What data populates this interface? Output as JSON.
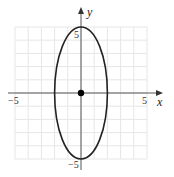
{
  "chart_data": {
    "type": "line",
    "title": "",
    "xlabel": "x",
    "ylabel": "y",
    "xlim": [
      -5,
      5
    ],
    "ylim": [
      -5,
      5
    ],
    "grid": true,
    "x_tick_labels": [
      "-5",
      "5"
    ],
    "y_tick_labels": [
      "5",
      "-5"
    ],
    "series": [
      {
        "name": "ellipse",
        "shape": "ellipse",
        "center": [
          0,
          0
        ],
        "semi_axis_x": 2,
        "semi_axis_y": 5,
        "equation": "x^2/4 + y^2/25 = 1"
      }
    ],
    "points": [
      {
        "name": "center",
        "x": 0,
        "y": 0
      }
    ]
  },
  "labels": {
    "x_axis": "x",
    "y_axis": "y",
    "x_neg": "−5",
    "x_pos": "5",
    "y_pos": "5",
    "y_neg": "−5"
  },
  "colors": {
    "grid": "#e6e6e6",
    "axis": "#444444",
    "curve": "#222222",
    "point": "#000000"
  }
}
